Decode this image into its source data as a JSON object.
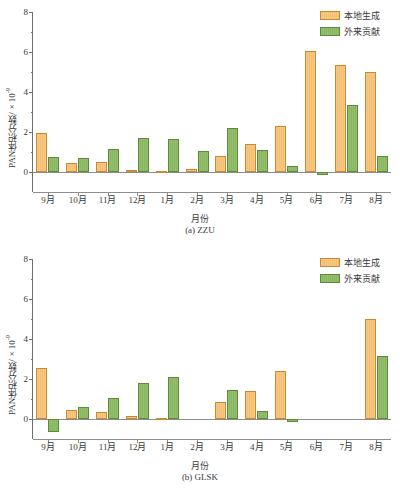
{
  "figure": {
    "legend": {
      "local_label": "本地生成",
      "external_label": "外来贡献",
      "local_color": "#f2bf73",
      "external_color": "#88b662"
    },
    "axis_titles": {
      "x": "月份",
      "y_prefix": "PAN体积分数/×10",
      "y_exponent": "-9"
    }
  },
  "chart_data": [
    {
      "type": "bar",
      "title": "(a) ZZU",
      "xlabel": "月份",
      "ylabel": "PAN体积分数/×10-9",
      "ylim": [
        -1,
        8
      ],
      "yticks": [
        0,
        2,
        4,
        6,
        8
      ],
      "ytick_labels": [
        "0",
        "2",
        "4",
        "6",
        "8"
      ],
      "grid": false,
      "legend_position": "top-right",
      "categories": [
        "9月",
        "10月",
        "11月",
        "12月",
        "1月",
        "2月",
        "3月",
        "4月",
        "5月",
        "6月",
        "7月",
        "8月"
      ],
      "series": [
        {
          "name": "本地生成",
          "color": "#f2bf73",
          "values": [
            1.94,
            0.47,
            0.48,
            0.08,
            0.07,
            0.14,
            0.81,
            1.4,
            2.28,
            6.05,
            5.35,
            4.98
          ]
        },
        {
          "name": "外来贡献",
          "color": "#88b662",
          "values": [
            0.77,
            0.7,
            1.14,
            1.68,
            1.67,
            1.04,
            2.19,
            1.09,
            0.3,
            -0.16,
            3.36,
            0.81
          ]
        }
      ]
    },
    {
      "type": "bar",
      "title": "(b) GLSK",
      "xlabel": "月份",
      "ylabel": "PAN体积分数/×10-9",
      "ylim": [
        -1,
        8
      ],
      "yticks": [
        0,
        2,
        4,
        6,
        8
      ],
      "ytick_labels": [
        "0",
        "2",
        "4",
        "6",
        "8"
      ],
      "grid": false,
      "legend_position": "top-right",
      "categories": [
        "9月",
        "10月",
        "11月",
        "12月",
        "1月",
        "2月",
        "3月",
        "4月",
        "5月",
        "6月",
        "7月",
        "8月"
      ],
      "series": [
        {
          "name": "本地生成",
          "color": "#f2bf73",
          "values": [
            2.57,
            0.45,
            0.33,
            0.13,
            0.05,
            null,
            0.86,
            1.4,
            2.4,
            null,
            null,
            5.0
          ]
        },
        {
          "name": "外来贡献",
          "color": "#88b662",
          "values": [
            -0.65,
            0.59,
            1.03,
            1.81,
            2.11,
            null,
            1.46,
            0.42,
            -0.13,
            null,
            null,
            3.13
          ]
        }
      ]
    }
  ]
}
